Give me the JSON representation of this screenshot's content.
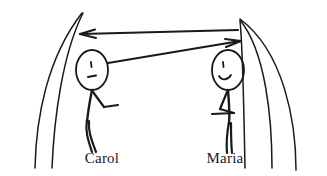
{
  "illustration": {
    "type": "hand-drawn-line-art",
    "description": "Two stick figures facing each other with two-way arrows between them inside a curved archway",
    "background_color": "#ffffff",
    "ink_color": "#1a1a1a",
    "figures": [
      {
        "id": "carol",
        "label": "Carol",
        "position": "left",
        "expression": "frowning",
        "eye": "short-vertical-tick",
        "mouth": "downturned-dash",
        "arm": "bent-elbow-forearm-pointing-right",
        "head_center": {
          "x": 92,
          "y": 70
        }
      },
      {
        "id": "maria",
        "label": "Maria",
        "position": "right",
        "expression": "smiling",
        "eye": "short-vertical-tick",
        "mouth": "upward-curve",
        "arm": "bent-elbow-hand-on-hip-triangle",
        "head_center": {
          "x": 228,
          "y": 70
        }
      }
    ],
    "arrows": [
      {
        "id": "arrow-to-carol",
        "direction": "right-to-left",
        "head_at": {
          "x": 80,
          "y": 34
        },
        "tail_at": {
          "x": 238,
          "y": 30
        },
        "style": "straight-horizontal"
      },
      {
        "id": "arrow-to-maria",
        "direction": "left-to-right",
        "head_at": {
          "x": 241,
          "y": 42
        },
        "tail_at": {
          "x": 108,
          "y": 63
        },
        "style": "straight-diagonal"
      }
    ],
    "background_curves": {
      "left_count": 2,
      "right_count": 3,
      "shape": "arch-like sweeping curves converging near the top"
    }
  },
  "labels": {
    "left_name": "Carol",
    "right_name": "Maria"
  }
}
